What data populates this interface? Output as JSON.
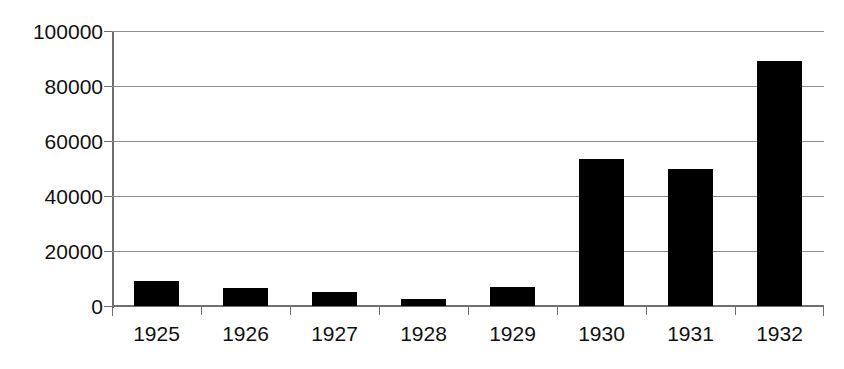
{
  "chart_data": {
    "type": "bar",
    "title": "",
    "subtitle": "",
    "xlabel": "",
    "ylabel": "",
    "categories": [
      "1925",
      "1926",
      "1927",
      "1928",
      "1929",
      "1930",
      "1931",
      "1932"
    ],
    "values": [
      9000,
      6500,
      5000,
      2500,
      7000,
      53500,
      50000,
      89500
    ],
    "ylim": [
      0,
      100000
    ],
    "ytick_labels": [
      "100000",
      "80000",
      "60000",
      "40000",
      "20000",
      "0"
    ],
    "ytick_values": [
      100000,
      80000,
      60000,
      40000,
      20000,
      0
    ],
    "grid": "horizontal",
    "legend": "none",
    "bar_color": "#000000",
    "gridline_color": "#8c8c8c",
    "axis_color": "#6e6e6e",
    "background_color": "#ffffff",
    "annotations": []
  }
}
